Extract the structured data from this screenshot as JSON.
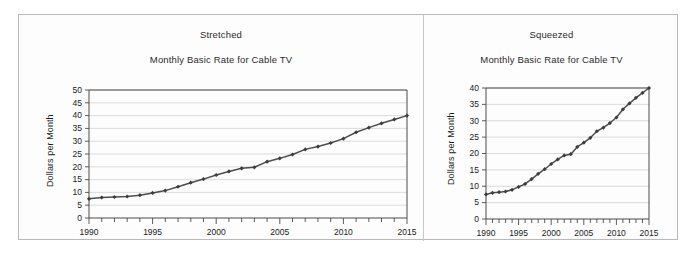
{
  "figure": {
    "background": "#ffffff",
    "frame_color": "#b9b9b9",
    "line_color": "#4d4d4d",
    "grid_color": "#d2d2d2"
  },
  "panels": [
    {
      "key": "stretched",
      "panel_label": "Stretched",
      "chart_title": "Monthly Basic Rate for Cable TV"
    },
    {
      "key": "squeezed",
      "panel_label": "Squeezed",
      "chart_title": "Monthly Basic Rate for Cable TV"
    }
  ],
  "chart_data": [
    {
      "type": "line",
      "key": "stretched",
      "title": "Monthly Basic Rate for Cable TV",
      "panel_label": "Stretched",
      "xlabel": "",
      "ylabel": "Dollars per Month",
      "xlim": [
        1990,
        2015
      ],
      "ylim": [
        0,
        50
      ],
      "ytick_step": 5,
      "yticks": [
        0,
        5,
        10,
        15,
        20,
        25,
        30,
        35,
        40,
        45,
        50
      ],
      "ytick_labels": [
        "0",
        "5",
        "10",
        "15",
        "20",
        "25",
        "30",
        "35",
        "40",
        "45",
        "50"
      ],
      "xticks": [
        1990,
        1995,
        2000,
        2005,
        2010,
        2015
      ],
      "xtick_labels": [
        "1990",
        "1995",
        "2000",
        "2005",
        "2010",
        "2015"
      ],
      "x_minor_tick_step": 1,
      "grid": "horizontal",
      "legend": "none",
      "marker": "diamond",
      "x": [
        1990,
        1991,
        1992,
        1993,
        1994,
        1995,
        1996,
        1997,
        1998,
        1999,
        2000,
        2001,
        2002,
        2003,
        2004,
        2005,
        2006,
        2007,
        2008,
        2009,
        2010,
        2011,
        2012,
        2013,
        2014,
        2015
      ],
      "values": [
        7.5,
        8.0,
        8.2,
        8.4,
        8.9,
        9.8,
        10.7,
        12.2,
        13.8,
        15.2,
        16.8,
        18.2,
        19.4,
        19.8,
        22.0,
        23.3,
        24.8,
        26.8,
        27.9,
        29.3,
        31.0,
        33.5,
        35.3,
        37.0,
        38.5,
        40.0
      ]
    },
    {
      "type": "line",
      "key": "squeezed",
      "title": "Monthly Basic Rate for Cable TV",
      "panel_label": "Squeezed",
      "xlabel": "",
      "ylabel": "Dollars per Month",
      "xlim": [
        1990,
        2015
      ],
      "ylim": [
        0,
        40
      ],
      "ytick_step": 5,
      "yticks": [
        0,
        5,
        10,
        15,
        20,
        25,
        30,
        35,
        40
      ],
      "ytick_labels": [
        "0",
        "5",
        "10",
        "15",
        "20",
        "25",
        "30",
        "35",
        "40"
      ],
      "xticks": [
        1990,
        1995,
        2000,
        2005,
        2010,
        2015
      ],
      "xtick_labels": [
        "1990",
        "1995",
        "2000",
        "2005",
        "2010",
        "2015"
      ],
      "x_minor_tick_step": 1,
      "grid": "horizontal",
      "legend": "none",
      "marker": "diamond",
      "x": [
        1990,
        1991,
        1992,
        1993,
        1994,
        1995,
        1996,
        1997,
        1998,
        1999,
        2000,
        2001,
        2002,
        2003,
        2004,
        2005,
        2006,
        2007,
        2008,
        2009,
        2010,
        2011,
        2012,
        2013,
        2014,
        2015
      ],
      "values": [
        7.5,
        8.0,
        8.2,
        8.4,
        8.9,
        9.8,
        10.7,
        12.2,
        13.8,
        15.2,
        16.8,
        18.2,
        19.4,
        19.8,
        22.0,
        23.3,
        24.8,
        26.8,
        27.9,
        29.3,
        31.0,
        33.5,
        35.3,
        37.0,
        38.5,
        40.0
      ]
    }
  ]
}
